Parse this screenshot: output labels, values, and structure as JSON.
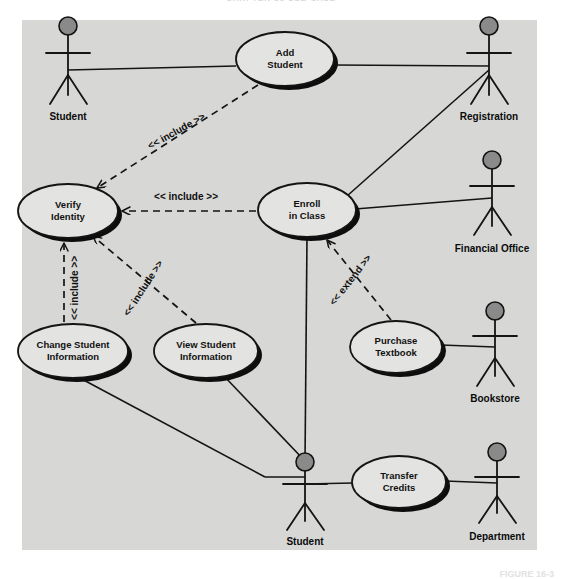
{
  "page": {
    "header_running_text": "CHAPTER 16    USE CASE",
    "figure_caption": "FIGURE 16-3",
    "panel_bg": "#d6d6d4",
    "ink": "#141414",
    "actor_head_fill": "#8a8a8a",
    "shadow": "#0d0d0d",
    "use_case_fill": "#e3e3e1"
  },
  "diagram": {
    "type": "uml-use-case",
    "actors": [
      {
        "id": "student-top",
        "label": "Student",
        "x": 68,
        "y": 48
      },
      {
        "id": "registration",
        "label": "Registration",
        "x": 489,
        "y": 48
      },
      {
        "id": "financial-office",
        "label": "Financial Office",
        "x": 492,
        "y": 180
      },
      {
        "id": "bookstore",
        "label": "Bookstore",
        "x": 495,
        "y": 330
      },
      {
        "id": "student-bottom",
        "label": "Student",
        "x": 305,
        "y": 462
      },
      {
        "id": "department",
        "label": "Department",
        "x": 497,
        "y": 470
      }
    ],
    "use_cases": [
      {
        "id": "add-student",
        "line1": "Add",
        "line2": "Student",
        "cx": 285,
        "cy": 59,
        "rx": 49,
        "ry": 27
      },
      {
        "id": "verify-identity",
        "line1": "Verify",
        "line2": "Identity",
        "cx": 68,
        "cy": 211,
        "rx": 50,
        "ry": 27
      },
      {
        "id": "enroll-in-class",
        "line1": "Enroll",
        "line2": "in Class",
        "cx": 307,
        "cy": 210,
        "rx": 49,
        "ry": 27
      },
      {
        "id": "change-student-info",
        "line1": "Change Student",
        "line2": "Information",
        "cx": 73,
        "cy": 351,
        "rx": 55,
        "ry": 27
      },
      {
        "id": "view-student-info",
        "line1": "View Student",
        "line2": "Information",
        "cx": 206,
        "cy": 351,
        "rx": 52,
        "ry": 27
      },
      {
        "id": "purchase-textbook",
        "line1": "Purchase",
        "line2": "Textbook",
        "cx": 396,
        "cy": 347,
        "rx": 46,
        "ry": 26
      },
      {
        "id": "transfer-credits",
        "line1": "Transfer",
        "line2": "Credits",
        "cx": 399,
        "cy": 482,
        "rx": 47,
        "ry": 26
      }
    ],
    "stereotypes": [
      {
        "id": "inc-add-student",
        "label": "<< include >>",
        "x": 178,
        "y": 134,
        "rotate": -29
      },
      {
        "id": "inc-enroll",
        "label": "<< include >>",
        "x": 186,
        "y": 200,
        "rotate": 0
      },
      {
        "id": "inc-change",
        "label": "<< include >>",
        "x": 78,
        "y": 288,
        "rotate": -90
      },
      {
        "id": "inc-view",
        "label": "<< include >>",
        "x": 146,
        "y": 290,
        "rotate": -57
      },
      {
        "id": "ext-purchase",
        "label": "<< extend >>",
        "x": 353,
        "y": 282,
        "rotate": -52
      }
    ],
    "associations": [
      {
        "id": "assoc-student-add",
        "from": "student-top",
        "to": "add-student"
      },
      {
        "id": "assoc-add-registration",
        "from": "add-student",
        "to": "registration"
      },
      {
        "id": "assoc-enroll-registration",
        "from": "enroll-in-class",
        "to": "registration"
      },
      {
        "id": "assoc-enroll-financial",
        "from": "enroll-in-class",
        "to": "financial-office"
      },
      {
        "id": "assoc-purchase-bookstore",
        "from": "purchase-textbook",
        "to": "bookstore"
      },
      {
        "id": "assoc-enroll-student",
        "from": "enroll-in-class",
        "to": "student-bottom"
      },
      {
        "id": "assoc-change-student",
        "from": "change-student-info",
        "to": "student-bottom"
      },
      {
        "id": "assoc-view-student",
        "from": "view-student-info",
        "to": "student-bottom"
      },
      {
        "id": "assoc-student-transfer",
        "from": "student-bottom",
        "to": "transfer-credits"
      },
      {
        "id": "assoc-transfer-department",
        "from": "transfer-credits",
        "to": "department"
      }
    ],
    "dependencies": [
      {
        "id": "dep-add-verify",
        "from": "add-student",
        "to": "verify-identity",
        "kind": "include"
      },
      {
        "id": "dep-enroll-verify",
        "from": "enroll-in-class",
        "to": "verify-identity",
        "kind": "include"
      },
      {
        "id": "dep-change-verify",
        "from": "change-student-info",
        "to": "verify-identity",
        "kind": "include"
      },
      {
        "id": "dep-view-verify",
        "from": "view-student-info",
        "to": "verify-identity",
        "kind": "include"
      },
      {
        "id": "dep-purchase-enroll",
        "from": "purchase-textbook",
        "to": "enroll-in-class",
        "kind": "extend"
      }
    ]
  }
}
